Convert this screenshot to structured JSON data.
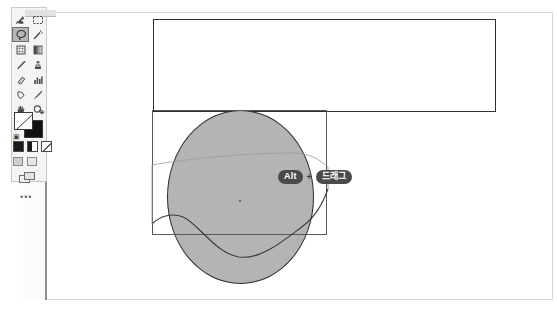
{
  "app": {
    "title": "Image Editor Canvas",
    "background_color": "#ffffff"
  },
  "toolbar": {
    "panel_name": "tools-panel",
    "selected_tool": "lasso-tool",
    "tools": [
      {
        "id": "move-tool",
        "label": "Move Tool",
        "icon": "move-icon",
        "selected": false
      },
      {
        "id": "marquee-tool",
        "label": "Rectangular Marquee Tool",
        "icon": "marquee-icon",
        "selected": false
      },
      {
        "id": "lasso-tool",
        "label": "Lasso Tool",
        "icon": "lasso-icon",
        "selected": true
      },
      {
        "id": "magic-wand-tool",
        "label": "Magic Wand Tool",
        "icon": "magic-wand-icon",
        "selected": false
      },
      {
        "id": "crop-tool",
        "label": "Crop Tool",
        "icon": "crop-icon",
        "selected": false
      },
      {
        "id": "gradient-tool",
        "label": "Gradient Tool",
        "icon": "gradient-icon",
        "selected": false
      },
      {
        "id": "brush-tool",
        "label": "Brush Tool",
        "icon": "brush-icon",
        "selected": false
      },
      {
        "id": "stamp-tool",
        "label": "Clone Stamp Tool",
        "icon": "stamp-icon",
        "selected": false
      },
      {
        "id": "eraser-tool",
        "label": "Eraser Tool",
        "icon": "eraser-icon",
        "selected": false
      },
      {
        "id": "blur-tool",
        "label": "Blur Tool",
        "icon": "blur-icon",
        "selected": false
      },
      {
        "id": "pen-tool",
        "label": "Pen Tool",
        "icon": "pen-icon",
        "selected": false
      },
      {
        "id": "eyedropper-tool",
        "label": "Eyedropper Tool",
        "icon": "eyedropper-icon",
        "selected": false
      },
      {
        "id": "hand-tool",
        "label": "Hand Tool",
        "icon": "hand-icon",
        "selected": false
      },
      {
        "id": "zoom-tool",
        "label": "Zoom Tool",
        "icon": "magnifier-icon",
        "selected": false
      }
    ],
    "color_swatches": {
      "foreground_label": "Foreground Color",
      "background_label": "Background Color",
      "foreground_color": "#ffffff",
      "background_color": "#111111",
      "swap_label": "Swap Colors",
      "reset_label": "Default Colors"
    },
    "mode_buttons": [
      {
        "id": "standard-mode",
        "label": "Standard Mask Mode"
      },
      {
        "id": "quick-mask-mode",
        "label": "Quick Mask Mode"
      },
      {
        "id": "alt-mask-mode",
        "label": "Alternate Mask Mode"
      }
    ],
    "screen_modes": [
      {
        "id": "standard-screen",
        "label": "Standard Screen Mode"
      },
      {
        "id": "full-screen",
        "label": "Full Screen Mode"
      }
    ],
    "extras": {
      "arrange_label": "Arrange Documents",
      "more_tools_label": "•••"
    }
  },
  "canvas": {
    "name": "artboard",
    "shapes": [
      {
        "id": "background-rectangle",
        "type": "rectangle",
        "stroke": "#2e2e2e",
        "fill": "#ffffff"
      },
      {
        "id": "ellipse-shape",
        "type": "ellipse",
        "fill": "#b4b4b4",
        "stroke": "#2b2b2b"
      },
      {
        "id": "selection-rectangle",
        "type": "rectangle",
        "stroke": "#575757",
        "fill": "none"
      },
      {
        "id": "wave-path",
        "type": "path",
        "stroke": "#3a3a3a",
        "fill": "none"
      }
    ],
    "anchor_point_label": "Center Anchor Point"
  },
  "shortcut_hint": {
    "name": "keyboard-shortcut-hint",
    "modifier_key": "Alt",
    "separator": "+",
    "action": "드래그",
    "badge_bg": "#4a4a4a",
    "badge_fg": "#ffffff"
  }
}
